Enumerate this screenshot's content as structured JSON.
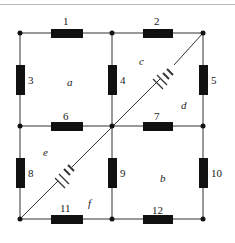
{
  "diagram": {
    "type": "circuit",
    "colors": {
      "wire": "#333333",
      "resistor": "#111111",
      "background": "#ffffff"
    },
    "resistors": [
      {
        "id": "1",
        "label": "1"
      },
      {
        "id": "2",
        "label": "2"
      },
      {
        "id": "3",
        "label": "3"
      },
      {
        "id": "4",
        "label": "4"
      },
      {
        "id": "5",
        "label": "5"
      },
      {
        "id": "6",
        "label": "6"
      },
      {
        "id": "7",
        "label": "7"
      },
      {
        "id": "8",
        "label": "8"
      },
      {
        "id": "9",
        "label": "9"
      },
      {
        "id": "10",
        "label": "10"
      },
      {
        "id": "11",
        "label": "11"
      },
      {
        "id": "12",
        "label": "12"
      }
    ],
    "loops": [
      "a",
      "b",
      "c",
      "d",
      "e",
      "f"
    ],
    "batteries": [
      {
        "name": "battery-upper",
        "position": "diagonal between center and top-right"
      },
      {
        "name": "battery-lower",
        "position": "diagonal between bottom-left and center"
      }
    ]
  }
}
